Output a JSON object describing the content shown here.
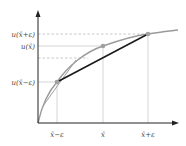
{
  "figure": {
    "y_labels": {
      "u_xbar_plus_eps": "u(x̄+ε)",
      "u_xbar": "u(x̄)",
      "u_xbar_minus_eps": "u(x̄−ε)"
    },
    "x_labels": {
      "xbar_minus_eps": "x̄−ε",
      "xbar": "x̄",
      "xbar_plus_eps": "x̄+ε"
    },
    "colors": {
      "curve": "#9a9a9a",
      "chord": "#1a1a1a",
      "axis": "#222222",
      "guide": "#bbbbbb",
      "point": "#a0a0a0"
    }
  }
}
